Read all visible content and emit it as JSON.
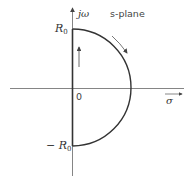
{
  "diagram": {
    "title": "s-plane",
    "axes": {
      "vertical_label": "jω",
      "horizontal_label": "σ",
      "origin_label": "0"
    },
    "contour": {
      "top_label": "R",
      "top_sub": "0",
      "bottom_label": "− R",
      "bottom_sub": "0",
      "shape": "semicircle-right-half-plane",
      "direction": "clockwise"
    },
    "colors": {
      "stroke": "#333333",
      "text": "#333333"
    }
  }
}
